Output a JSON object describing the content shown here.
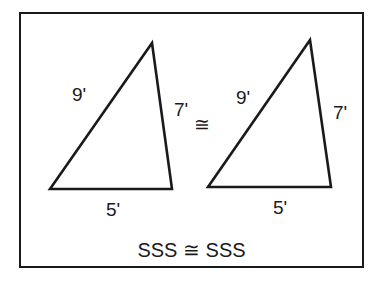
{
  "figure": {
    "left_triangle": {
      "vertices": [
        [
          50,
          189
        ],
        [
          152,
          43
        ],
        [
          172,
          189
        ]
      ],
      "labels": {
        "long_side": "9'",
        "right_side": "7'",
        "base": "5'"
      }
    },
    "right_triangle": {
      "vertices": [
        [
          208,
          187
        ],
        [
          310,
          40
        ],
        [
          331,
          187
        ]
      ],
      "labels": {
        "long_side": "9'",
        "right_side": "7'",
        "base": "5'"
      }
    },
    "congruence_symbol": "≅",
    "caption": "SSS ≅ SSS",
    "stroke_color": "#1a1a1a",
    "background": "#ffffff"
  }
}
